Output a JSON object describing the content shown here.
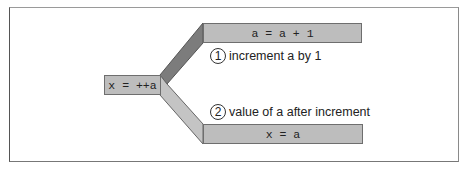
{
  "diagram": {
    "source_expression": "x = ++a",
    "steps": [
      {
        "number": "1",
        "code": "a = a + 1",
        "description": "increment a by 1"
      },
      {
        "number": "2",
        "code": "x = a",
        "description": "value of a after increment"
      }
    ],
    "colors": {
      "box_fill": "#bdbdbd",
      "upper_connector": "#7c7c7c",
      "lower_connector": "#c4c4c4",
      "border": "#6e6e6e"
    }
  }
}
